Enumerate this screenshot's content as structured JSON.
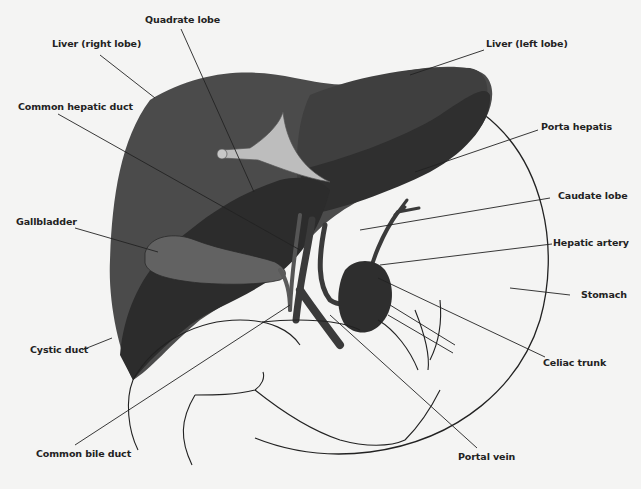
{
  "diagram": {
    "colors": {
      "background": "#f4f4f3",
      "liver_right": "#4a4a4a",
      "liver_dark": "#2e2e2e",
      "ligament": "#b5b5b5",
      "gallbladder": "#5f5f5f",
      "vessels": "#3a3a3a",
      "stomach_outline": "#222222",
      "leader_line": "#222222"
    },
    "labels": [
      {
        "id": "quadrate-lobe",
        "text": "Quadrate lobe"
      },
      {
        "id": "liver-right-lobe",
        "text": "Liver (right lobe)"
      },
      {
        "id": "common-hepatic-duct",
        "text": "Common hepatic duct"
      },
      {
        "id": "gallbladder",
        "text": "Gallbladder"
      },
      {
        "id": "cystic-duct",
        "text": "Cystic duct"
      },
      {
        "id": "common-bile-duct",
        "text": "Common bile duct"
      },
      {
        "id": "liver-left-lobe",
        "text": "Liver (left lobe)"
      },
      {
        "id": "porta-hepatis",
        "text": "Porta hepatis"
      },
      {
        "id": "caudate-lobe",
        "text": "Caudate lobe"
      },
      {
        "id": "hepatic-artery",
        "text": "Hepatic artery"
      },
      {
        "id": "stomach",
        "text": "Stomach"
      },
      {
        "id": "celiac-trunk",
        "text": "Celiac trunk"
      },
      {
        "id": "portal-vein",
        "text": "Portal vein"
      }
    ]
  }
}
